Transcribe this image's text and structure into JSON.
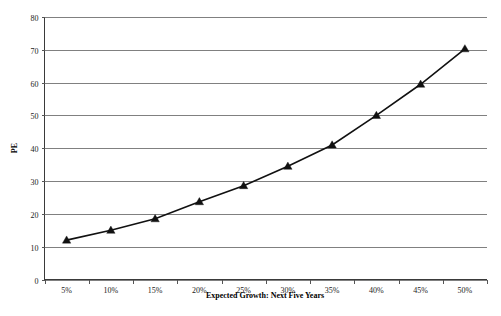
{
  "chart_data": {
    "type": "line",
    "title": "",
    "xlabel": "Expected Growth: Next Five Years",
    "ylabel": "PE",
    "categories": [
      "5%",
      "10%",
      "15%",
      "20%",
      "25%",
      "30%",
      "35%",
      "40%",
      "45%",
      "50%"
    ],
    "x": [
      5,
      10,
      15,
      20,
      25,
      30,
      35,
      40,
      45,
      50
    ],
    "values": [
      12,
      15,
      18.5,
      23.7,
      28.6,
      34.5,
      41,
      50,
      59.5,
      70.3
    ],
    "series": [
      {
        "name": "PE",
        "values": [
          12,
          15,
          18.5,
          23.7,
          28.6,
          34.5,
          41,
          50,
          59.5,
          70.3
        ],
        "marker": "triangle",
        "color": "#111111"
      }
    ],
    "ylim": [
      0,
      80
    ],
    "yticks": [
      0,
      10,
      20,
      30,
      40,
      50,
      60,
      70,
      80
    ],
    "ytick_labels": [
      "0",
      "10",
      "20",
      "30",
      "40",
      "50",
      "60",
      "70",
      "80"
    ],
    "grid": true,
    "grid_axis": "y",
    "legend": false,
    "legend_position": "none",
    "background": "#ffffff",
    "gridline_color": "#808080",
    "axis_color": "#3a3a3a"
  },
  "axes": {
    "y_title": "PE",
    "x_title": "Expected Growth: Next Five Years"
  },
  "ticks": {
    "y": [
      "0",
      "10",
      "20",
      "30",
      "40",
      "50",
      "60",
      "70",
      "80"
    ],
    "x": [
      "5%",
      "10%",
      "15%",
      "20%",
      "25%",
      "30%",
      "35%",
      "40%",
      "45%",
      "50%"
    ]
  }
}
